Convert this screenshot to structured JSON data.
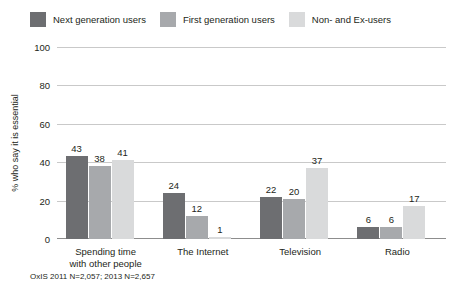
{
  "chart_data": {
    "type": "bar",
    "title": "",
    "xlabel": "",
    "ylabel": "% who say it is essential",
    "ylim": [
      0,
      100
    ],
    "yticks": [
      "0",
      "20",
      "40",
      "60",
      "80",
      "100"
    ],
    "grid": true,
    "legend_position": "top-left",
    "categories": [
      "Spending time with other people",
      "The Internet",
      "Television",
      "Radio"
    ],
    "category_lines": [
      [
        "Spending time",
        "with other people"
      ],
      [
        "The Internet"
      ],
      [
        "Television"
      ],
      [
        "Radio"
      ]
    ],
    "series": [
      {
        "name": "Next generation users",
        "color": "#6d6e71",
        "values": [
          43,
          24,
          22,
          6
        ],
        "labels": [
          "43",
          "24",
          "22",
          "6"
        ]
      },
      {
        "name": "First generation users",
        "color": "#a7a9ac",
        "values": [
          38,
          12,
          21,
          6
        ],
        "labels": [
          "38",
          "12",
          "20",
          "6"
        ]
      },
      {
        "name": "Non- and Ex-users",
        "color": "#d9dadb",
        "values": [
          41,
          1,
          37,
          17
        ],
        "labels": [
          "41",
          "1",
          "37",
          "17"
        ]
      }
    ],
    "footnote": "OxIS 2011 N=2,057; 2013 N=2,657"
  }
}
